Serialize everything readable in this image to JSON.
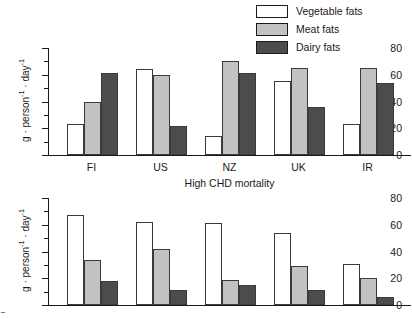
{
  "legend": {
    "position": "top-right",
    "items": [
      {
        "label": "Vegetable fats",
        "color": "#ffffff",
        "name": "vegetable-fats"
      },
      {
        "label": "Meat fats",
        "color": "#c2c2c2",
        "name": "meat-fats"
      },
      {
        "label": "Dairy fats",
        "color": "#4c4c4c",
        "name": "dairy-fats"
      }
    ]
  },
  "chart_data": [
    {
      "type": "bar",
      "id": "high-chd-mortality",
      "title": "",
      "xlabel": "High  CHD mortality",
      "ylabel": "g · person⁻¹ · day⁻¹",
      "ylim": [
        0,
        80
      ],
      "yticks": [
        0,
        20,
        40,
        60,
        80
      ],
      "yminor_step": 10,
      "grid": false,
      "categories": [
        "FI",
        "US",
        "NZ",
        "UK",
        "IR"
      ],
      "series": [
        {
          "name": "Vegetable fats",
          "color": "#ffffff",
          "values": [
            23,
            64,
            14,
            55,
            23
          ]
        },
        {
          "name": "Meat fats",
          "color": "#c2c2c2",
          "values": [
            40,
            60,
            70,
            65,
            65
          ]
        },
        {
          "name": "Dairy fats",
          "color": "#4c4c4c",
          "values": [
            61,
            22,
            61,
            36,
            54
          ]
        }
      ]
    },
    {
      "type": "bar",
      "id": "lower-chd-mortality",
      "title": "",
      "xlabel": "",
      "ylabel": "g · person⁻¹ · day⁻¹",
      "ylim": [
        0,
        80
      ],
      "yticks": [
        0,
        20,
        40,
        60,
        80
      ],
      "yminor_step": 10,
      "grid": false,
      "categories": [
        "",
        "",
        "",
        "",
        ""
      ],
      "series": [
        {
          "name": "Vegetable fats",
          "color": "#ffffff",
          "values": [
            67,
            62,
            61,
            54,
            31
          ]
        },
        {
          "name": "Meat fats",
          "color": "#c2c2c2",
          "values": [
            34,
            42,
            19,
            29,
            20
          ]
        },
        {
          "name": "Dairy fats",
          "color": "#4c4c4c",
          "values": [
            18,
            11,
            15,
            11,
            6
          ]
        }
      ]
    }
  ],
  "axis_labels": {
    "y_top": "g · person⁻¹ · day⁻¹",
    "y_bottom": "g · person⁻¹ · day⁻¹",
    "x_top": "High  CHD mortality"
  }
}
